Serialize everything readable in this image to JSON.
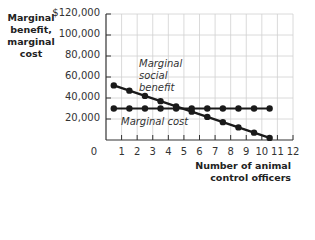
{
  "chart_data": {
    "type": "line",
    "title": "",
    "xlabel": "Number of animal control officers",
    "ylabel": "Marginal benefit, marginal cost",
    "x_ticks": [
      "0",
      "1",
      "2",
      "3",
      "4",
      "5",
      "6",
      "7",
      "8",
      "9",
      "10",
      "11",
      "12"
    ],
    "y_ticks": [
      "$120,000",
      "100,000",
      "80,000",
      "60,000",
      "40,000",
      "20,000"
    ],
    "xlim": [
      0,
      12
    ],
    "ylim": [
      0,
      120000
    ],
    "grid": true,
    "x": [
      0.5,
      1.5,
      2.5,
      3.5,
      4.5,
      5.5,
      6.5,
      7.5,
      8.5,
      9.5,
      10.5
    ],
    "series": [
      {
        "name": "Marginal social benefit",
        "values": [
          52000,
          47000,
          42000,
          37000,
          32000,
          27000,
          22000,
          17000,
          12000,
          7000,
          2000
        ]
      },
      {
        "name": "Marginal cost",
        "values": [
          30000,
          30000,
          30000,
          30000,
          30000,
          30000,
          30000,
          30000,
          30000,
          30000,
          30000
        ]
      }
    ],
    "annotations": [
      "Marginal social benefit",
      "Marginal cost"
    ]
  },
  "labels": {
    "ylabel": "Marginal benefit, marginal cost",
    "xlabel_line1": "Number of animal",
    "xlabel_line2": "control officers",
    "msb_line1": "Marginal",
    "msb_line2": "social",
    "msb_line3": "benefit",
    "mc": "Marginal cost"
  },
  "colors": {
    "line": "#1a1a1a",
    "grid": "#d0d0d0",
    "axis": "#333333"
  }
}
